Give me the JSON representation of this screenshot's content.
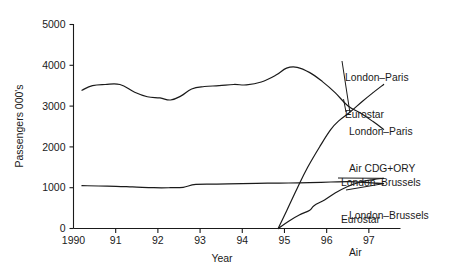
{
  "chart_data": {
    "type": "line",
    "title": "",
    "subtitle": "",
    "xlabel": "Year",
    "ylabel": "Passengers 000's",
    "xlim": [
      1990,
      1997.75
    ],
    "ylim": [
      0,
      5000
    ],
    "grid": false,
    "legend_position": "inline-right-annotations",
    "x_tick_values": [
      1990,
      1991,
      1992,
      1993,
      1994,
      1995,
      1996,
      1997
    ],
    "x_tick_labels": [
      "1990",
      "91",
      "92",
      "93",
      "94",
      "95",
      "96",
      "97"
    ],
    "y_tick_values": [
      0,
      1000,
      2000,
      3000,
      4000,
      5000
    ],
    "y_tick_labels": [
      "0",
      "1000",
      "2000",
      "3000",
      "4000",
      "5000"
    ],
    "series": [
      {
        "name": "London–Paris Air CDG+ORY",
        "label_line1": "London–Paris",
        "label_line2": "Air CDG+ORY",
        "x": [
          1990.2,
          1990.45,
          1990.75,
          1991.1,
          1991.45,
          1991.75,
          1992.05,
          1992.3,
          1992.55,
          1992.8,
          1993.1,
          1993.45,
          1993.8,
          1994.1,
          1994.45,
          1994.8,
          1995.05,
          1995.3,
          1995.6,
          1995.9,
          1996.2,
          1996.5,
          1996.8,
          1997.1,
          1997.35
        ],
        "values": [
          3390,
          3500,
          3530,
          3530,
          3340,
          3230,
          3200,
          3150,
          3250,
          3420,
          3480,
          3500,
          3530,
          3520,
          3590,
          3760,
          3930,
          3950,
          3820,
          3600,
          3330,
          3010,
          2830,
          2620,
          2430
        ]
      },
      {
        "name": "London–Paris Eurostar",
        "label_line1": "London–Paris",
        "label_line2": "Eurostar",
        "x": [
          1994.85,
          1995.05,
          1995.3,
          1995.55,
          1995.85,
          1996.1,
          1996.3,
          1996.55,
          1996.85,
          1997.1,
          1997.35
        ],
        "values": [
          0,
          430,
          980,
          1500,
          2030,
          2430,
          2650,
          2850,
          3120,
          3330,
          3530
        ]
      },
      {
        "name": "London–Brussels Eurostar",
        "label_line1": "London–Brussels",
        "label_line2": "Eurostar",
        "x": [
          1994.85,
          1995.1,
          1995.35,
          1995.6,
          1995.7,
          1995.95,
          1996.2,
          1996.5,
          1996.8,
          1997.1,
          1997.35
        ],
        "values": [
          0,
          180,
          330,
          450,
          560,
          700,
          870,
          1030,
          1140,
          1200,
          1230
        ]
      },
      {
        "name": "London–Brussels Air",
        "label_line1": "London–Brussels",
        "label_line2": "Air",
        "x": [
          1990.2,
          1990.8,
          1991.4,
          1991.9,
          1992.3,
          1992.6,
          1992.9,
          1993.4,
          1994.0,
          1994.6,
          1995.1,
          1995.6,
          1996.1,
          1996.55,
          1996.9,
          1997.2,
          1997.35
        ],
        "values": [
          1050,
          1040,
          1020,
          1000,
          1000,
          1010,
          1080,
          1090,
          1100,
          1110,
          1115,
          1125,
          1140,
          1150,
          1130,
          1110,
          1100
        ]
      }
    ],
    "annotations": [
      {
        "id": "label-london-paris-eurostar",
        "line1": "London–Paris",
        "line2": "Eurostar"
      },
      {
        "id": "label-london-paris-air",
        "line1": "London–Paris",
        "line2": "Air CDG+ORY"
      },
      {
        "id": "label-london-brussels-eurostar",
        "line1": "London–Brussels",
        "line2": "Eurostar"
      },
      {
        "id": "label-london-brussels-air",
        "line1": "London–Brussels",
        "line2": "Air"
      }
    ],
    "colors": {
      "line": "#1a1a1a",
      "axis": "#1a1a1a",
      "background": "#ffffff"
    }
  }
}
